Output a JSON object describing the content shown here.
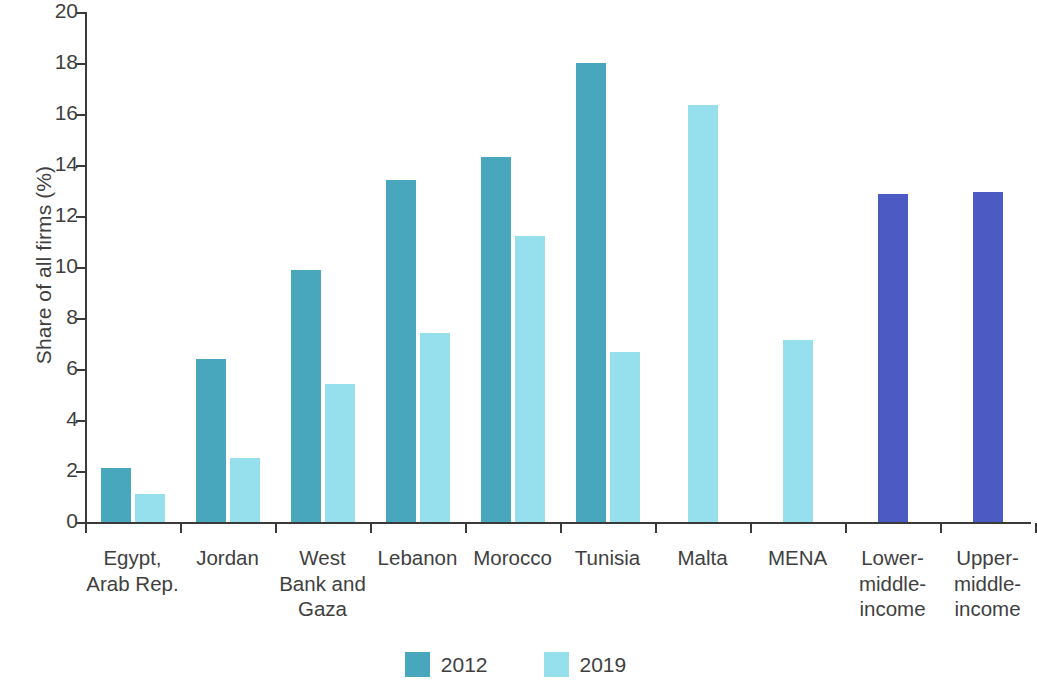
{
  "chart_data": {
    "type": "bar",
    "title": "",
    "subtitle": "",
    "xlabel": "",
    "ylabel": "Share of all firms (%)",
    "ylim": [
      0,
      20
    ],
    "ytick_labels": [
      "20",
      "18",
      "16",
      "14",
      "12",
      "10",
      "8",
      "6",
      "4",
      "2",
      "0"
    ],
    "yticks": [
      20,
      18,
      16,
      14,
      12,
      10,
      8,
      6,
      4,
      2,
      0
    ],
    "grid": false,
    "legend_position": "bottom-center",
    "categories": [
      "Egypt,\nArab Rep.",
      "Jordan",
      "West\nBank and\nGaza",
      "Lebanon",
      "Morocco",
      "Tunisia",
      "Malta",
      "MENA",
      "Lower-\nmiddle-\nincome",
      "Upper-\nmiddle-\nincome"
    ],
    "series": [
      {
        "name": "2012",
        "color": "#49a7bd",
        "values": [
          2.1,
          6.4,
          9.9,
          13.4,
          14.3,
          18.0,
          null,
          null,
          null,
          null
        ]
      },
      {
        "name": "2019",
        "color": "#96e0ee",
        "values": [
          1.1,
          2.5,
          5.4,
          7.4,
          11.2,
          6.65,
          16.35,
          7.15,
          null,
          null
        ]
      },
      {
        "name": "benchmark",
        "color": "#4c5bc4",
        "values": [
          null,
          null,
          null,
          null,
          null,
          null,
          null,
          null,
          12.85,
          12.95
        ]
      }
    ],
    "legend": [
      {
        "label": "2012",
        "color": "#49a7bd"
      },
      {
        "label": "2019",
        "color": "#96e0ee"
      }
    ],
    "colors": {
      "series_2012": "#49a7bd",
      "series_2019": "#96e0ee",
      "benchmark": "#4c5bc4",
      "axis": "#3a3a3a",
      "text": "#3f3f3f",
      "background": "#ffffff"
    }
  }
}
